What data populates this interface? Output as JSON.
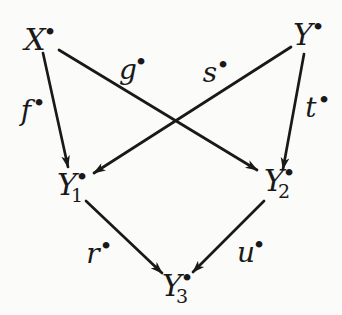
{
  "figure": {
    "type": "commutative-diagram",
    "background": "#fbfbf9",
    "ink": "#191919",
    "nodes": [
      {
        "id": "X",
        "base": "X",
        "sub": "",
        "bullet": "•",
        "x": 35,
        "y": 40
      },
      {
        "id": "Y",
        "base": "Y",
        "sub": "",
        "bullet": "•",
        "x": 303,
        "y": 35
      },
      {
        "id": "Y1",
        "base": "Y",
        "sub": "1",
        "bullet": "•",
        "x": 67,
        "y": 185
      },
      {
        "id": "Y2",
        "base": "Y",
        "sub": "2",
        "bullet": "•",
        "x": 274,
        "y": 181
      },
      {
        "id": "Y3",
        "base": "Y",
        "sub": "3",
        "bullet": "•",
        "x": 172,
        "y": 286
      }
    ],
    "edges": [
      {
        "id": "f",
        "label": "f",
        "bullet": "•",
        "from": "X",
        "to": "Y1",
        "x1": 43,
        "y1": 53,
        "x2": 68,
        "y2": 167,
        "lx": 26,
        "ly": 111
      },
      {
        "id": "g",
        "label": "g",
        "bullet": "•",
        "from": "X",
        "to": "Y2",
        "x1": 59,
        "y1": 50,
        "x2": 257,
        "y2": 170,
        "lx": 128,
        "ly": 70
      },
      {
        "id": "s",
        "label": "s",
        "bullet": "•",
        "from": "Y",
        "to": "Y1",
        "x1": 291,
        "y1": 47,
        "x2": 94,
        "y2": 173,
        "lx": 210,
        "ly": 73
      },
      {
        "id": "t",
        "label": "t",
        "bullet": "•",
        "from": "Y",
        "to": "Y2",
        "x1": 304,
        "y1": 54,
        "x2": 283,
        "y2": 169,
        "lx": 311,
        "ly": 108
      },
      {
        "id": "r",
        "label": "r",
        "bullet": "•",
        "from": "Y1",
        "to": "Y3",
        "x1": 86,
        "y1": 201,
        "x2": 162,
        "y2": 273,
        "lx": 93,
        "ly": 254
      },
      {
        "id": "u",
        "label": "u",
        "bullet": "•",
        "from": "Y2",
        "to": "Y3",
        "x1": 264,
        "y1": 201,
        "x2": 193,
        "y2": 272,
        "lx": 246,
        "ly": 253
      }
    ]
  }
}
